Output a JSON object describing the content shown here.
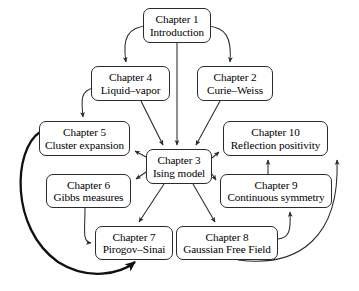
{
  "diagram": {
    "type": "flowchart",
    "stroke_color": "#2b2b2b",
    "background_color": "#ffffff",
    "nodes": [
      {
        "id": "ch1",
        "chapter": "Chapter 1",
        "title": "Introduction"
      },
      {
        "id": "ch2",
        "chapter": "Chapter 2",
        "title": "Curie–Weiss"
      },
      {
        "id": "ch3",
        "chapter": "Chapter 3",
        "title": "Ising model"
      },
      {
        "id": "ch4",
        "chapter": "Chapter 4",
        "title": "Liquid–vapor"
      },
      {
        "id": "ch5",
        "chapter": "Chapter 5",
        "title": "Cluster expansion"
      },
      {
        "id": "ch6",
        "chapter": "Chapter 6",
        "title": "Gibbs measures"
      },
      {
        "id": "ch7",
        "chapter": "Chapter 7",
        "title": "Pirogov–Sinai"
      },
      {
        "id": "ch8",
        "chapter": "Chapter 8",
        "title": "Gaussian Free Field"
      },
      {
        "id": "ch9",
        "chapter": "Chapter 9",
        "title": "Continuous symmetry"
      },
      {
        "id": "ch10",
        "chapter": "Chapter 10",
        "title": "Reflection positivity"
      }
    ],
    "edges": [
      {
        "from": "ch1",
        "to": "ch4",
        "style": "curved"
      },
      {
        "from": "ch1",
        "to": "ch2",
        "style": "curved"
      },
      {
        "from": "ch1",
        "to": "ch3",
        "style": "straight"
      },
      {
        "from": "ch4",
        "to": "ch5",
        "style": "curved"
      },
      {
        "from": "ch4",
        "to": "ch3",
        "style": "straight"
      },
      {
        "from": "ch2",
        "to": "ch3",
        "style": "straight"
      },
      {
        "from": "ch3",
        "to": "ch5",
        "style": "straight"
      },
      {
        "from": "ch3",
        "to": "ch6",
        "style": "straight"
      },
      {
        "from": "ch3",
        "to": "ch10",
        "style": "straight"
      },
      {
        "from": "ch3",
        "to": "ch9",
        "style": "straight"
      },
      {
        "from": "ch3",
        "to": "ch7",
        "style": "straight"
      },
      {
        "from": "ch3",
        "to": "ch8",
        "style": "straight"
      },
      {
        "from": "ch6",
        "to": "ch7",
        "style": "curved"
      },
      {
        "from": "ch9",
        "to": "ch10",
        "style": "straight"
      },
      {
        "from": "ch8",
        "to": "ch9",
        "style": "curved"
      },
      {
        "from": "ch8",
        "to": "ch10",
        "style": "curved"
      },
      {
        "from": "ch5",
        "to": "ch7",
        "style": "curved-thick"
      }
    ]
  }
}
